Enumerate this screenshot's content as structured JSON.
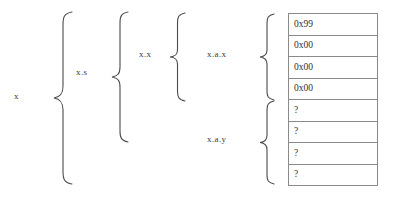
{
  "diagram": {
    "background_color": "#ffffff",
    "text_color": "#3a3a3a",
    "border_color": "#8a8a8a",
    "labels": {
      "level1": "x",
      "level2": "x.s",
      "level3": "x.x",
      "level4_top": "x.a.x",
      "level4_bottom": "x.a.y"
    },
    "byte_table": {
      "row_count": 8,
      "rows": [
        {
          "value": "0x99"
        },
        {
          "value": "0x00"
        },
        {
          "value": "0x00"
        },
        {
          "value": "0x00"
        },
        {
          "value": "?"
        },
        {
          "value": "?"
        },
        {
          "value": "?"
        },
        {
          "value": "?"
        }
      ]
    }
  }
}
